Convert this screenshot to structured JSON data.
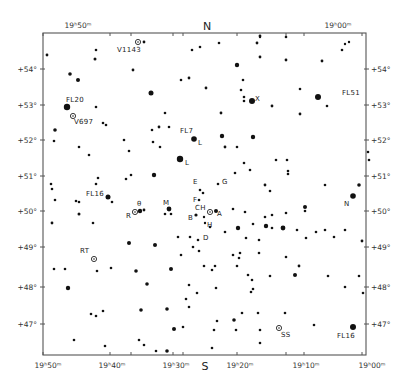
{
  "chart_data": {
    "type": "scatter",
    "title": "",
    "subtitle": "Star field finder chart (Cygnus region)",
    "xlabel": "Right Ascension",
    "ylabel": "Declination",
    "cardinal": {
      "top": "N",
      "bottom": "S"
    },
    "frame": {
      "left": 43,
      "top": 33,
      "right": 366,
      "bottom": 355
    },
    "ra_ticks": [
      {
        "label": "19ʰ50ᵐ",
        "x": 43,
        "top_label": true,
        "bottom_label": true
      },
      {
        "label": "19ʰ40ᵐ",
        "x": 110,
        "top_label": false,
        "bottom_label": true
      },
      {
        "label": "",
        "x": 131,
        "top_label": false,
        "bottom_label": false
      },
      {
        "label": "19ʰ30ᵐ",
        "x": 173,
        "top_label": false,
        "bottom_label": true
      },
      {
        "label": "",
        "x": 183,
        "top_label": false,
        "bottom_label": false
      },
      {
        "label": "19ʰ20ᵐ",
        "x": 237,
        "top_label": false,
        "bottom_label": true
      },
      {
        "label": "",
        "x": 286,
        "top_label": false,
        "bottom_label": false
      },
      {
        "label": "19ʰ10ᵐ",
        "x": 304,
        "top_label": false,
        "bottom_label": true
      },
      {
        "label": "19ʰ00ᵐ",
        "x": 362,
        "top_label": true,
        "bottom_label": true
      }
    ],
    "top_ra_labels": [
      {
        "label": "19ʰ50ᵐ",
        "x": 78
      },
      {
        "label": "19ʰ00ᵐ",
        "x": 338
      }
    ],
    "bottom_ra_labels": [
      {
        "label": "19ʰ50ᵐ",
        "x": 48
      },
      {
        "label": "19ʰ40ᵐ",
        "x": 112
      },
      {
        "label": "19ʰ30ᵐ",
        "x": 176
      },
      {
        "label": "19ʰ20ᵐ",
        "x": 240
      },
      {
        "label": "19ʰ10ᵐ",
        "x": 306
      },
      {
        "label": "19ʰ00ᵐ",
        "x": 372
      }
    ],
    "dec_ticks": [
      {
        "label": "+54°",
        "y": 69
      },
      {
        "label": "+53°",
        "y": 105
      },
      {
        "label": "+52°",
        "y": 140
      },
      {
        "label": "+51°",
        "y": 176
      },
      {
        "label": "+50°",
        "y": 211
      },
      {
        "label": "+49°",
        "y": 247
      },
      {
        "label": "+48°",
        "y": 287
      },
      {
        "label": "+47°",
        "y": 324
      }
    ],
    "grid": false,
    "legend": "none",
    "labels": [
      {
        "text": "V1143",
        "x": 117,
        "y": 52
      },
      {
        "text": "FL20",
        "x": 66,
        "y": 102
      },
      {
        "text": "V697",
        "x": 74,
        "y": 124
      },
      {
        "text": "FL51",
        "x": 342,
        "y": 95
      },
      {
        "text": "X",
        "x": 255,
        "y": 101
      },
      {
        "text": "FL7",
        "x": 180,
        "y": 133
      },
      {
        "text": "L",
        "x": 198,
        "y": 145
      },
      {
        "text": "L",
        "x": 185,
        "y": 165
      },
      {
        "text": "E",
        "x": 193,
        "y": 184
      },
      {
        "text": "G",
        "x": 222,
        "y": 184
      },
      {
        "text": "F",
        "x": 193,
        "y": 202
      },
      {
        "text": "CH",
        "x": 195,
        "y": 210
      },
      {
        "text": "FL16",
        "x": 86,
        "y": 196
      },
      {
        "text": "θ",
        "x": 137,
        "y": 206
      },
      {
        "text": "M",
        "x": 163,
        "y": 205
      },
      {
        "text": "R",
        "x": 126,
        "y": 218
      },
      {
        "text": "B",
        "x": 188,
        "y": 220
      },
      {
        "text": "A",
        "x": 217,
        "y": 216
      },
      {
        "text": "H",
        "x": 207,
        "y": 227
      },
      {
        "text": "N",
        "x": 344,
        "y": 206
      },
      {
        "text": "D",
        "x": 203,
        "y": 240
      },
      {
        "text": "RT",
        "x": 80,
        "y": 253
      },
      {
        "text": "SS",
        "x": 281,
        "y": 337
      },
      {
        "text": "FL16",
        "x": 337,
        "y": 338
      }
    ],
    "variables": [
      {
        "name": "V1143",
        "x": 138,
        "y": 42
      },
      {
        "name": "V697",
        "x": 73,
        "y": 116
      },
      {
        "name": "RT",
        "x": 94,
        "y": 259
      },
      {
        "name": "SS",
        "x": 279,
        "y": 328
      },
      {
        "name": "R",
        "x": 135,
        "y": 212
      },
      {
        "name": "CH",
        "x": 210,
        "y": 212
      }
    ],
    "stars": [
      {
        "x": 47,
        "y": 55,
        "s": 1.4
      },
      {
        "x": 96,
        "y": 50,
        "s": 1.3
      },
      {
        "x": 95,
        "y": 59,
        "s": 1.5
      },
      {
        "x": 144,
        "y": 42,
        "s": 1.4
      },
      {
        "x": 133,
        "y": 70,
        "s": 1.4
      },
      {
        "x": 70,
        "y": 74,
        "s": 1.8
      },
      {
        "x": 78,
        "y": 80,
        "s": 2.0
      },
      {
        "x": 151,
        "y": 93,
        "s": 2.5
      },
      {
        "x": 96,
        "y": 107,
        "s": 1.3
      },
      {
        "x": 67,
        "y": 107,
        "s": 3.2
      },
      {
        "x": 192,
        "y": 50,
        "s": 1.3
      },
      {
        "x": 200,
        "y": 47,
        "s": 1.3
      },
      {
        "x": 181,
        "y": 80,
        "s": 1.3
      },
      {
        "x": 189,
        "y": 78,
        "s": 1.4
      },
      {
        "x": 206,
        "y": 88,
        "s": 1.4
      },
      {
        "x": 219,
        "y": 43,
        "s": 1.3
      },
      {
        "x": 257,
        "y": 43,
        "s": 1.4
      },
      {
        "x": 260,
        "y": 36,
        "s": 1.4
      },
      {
        "x": 237,
        "y": 65,
        "s": 2.2
      },
      {
        "x": 243,
        "y": 80,
        "s": 1.3
      },
      {
        "x": 241,
        "y": 90,
        "s": 1.3
      },
      {
        "x": 244,
        "y": 97,
        "s": 1.3
      },
      {
        "x": 244,
        "y": 101,
        "s": 1.3
      },
      {
        "x": 252,
        "y": 101,
        "s": 3.0
      },
      {
        "x": 260,
        "y": 37,
        "s": 1.2
      },
      {
        "x": 286,
        "y": 37,
        "s": 1.3
      },
      {
        "x": 260,
        "y": 57,
        "s": 1.4
      },
      {
        "x": 286,
        "y": 60,
        "s": 1.4
      },
      {
        "x": 322,
        "y": 61,
        "s": 1.4
      },
      {
        "x": 345,
        "y": 44,
        "s": 1.2
      },
      {
        "x": 349,
        "y": 42,
        "s": 1.2
      },
      {
        "x": 342,
        "y": 50,
        "s": 1.3
      },
      {
        "x": 300,
        "y": 89,
        "s": 1.3
      },
      {
        "x": 318,
        "y": 97,
        "s": 3.0
      },
      {
        "x": 327,
        "y": 106,
        "s": 1.3
      },
      {
        "x": 272,
        "y": 106,
        "s": 1.4
      },
      {
        "x": 300,
        "y": 114,
        "s": 1.4
      },
      {
        "x": 221,
        "y": 113,
        "s": 1.4
      },
      {
        "x": 55,
        "y": 130,
        "s": 1.8
      },
      {
        "x": 54,
        "y": 141,
        "s": 1.3
      },
      {
        "x": 79,
        "y": 147,
        "s": 1.3
      },
      {
        "x": 89,
        "y": 155,
        "s": 1.3
      },
      {
        "x": 103,
        "y": 123,
        "s": 1.3
      },
      {
        "x": 106,
        "y": 125,
        "s": 1.3
      },
      {
        "x": 124,
        "y": 140,
        "s": 1.3
      },
      {
        "x": 129,
        "y": 151,
        "s": 1.3
      },
      {
        "x": 153,
        "y": 142,
        "s": 1.3
      },
      {
        "x": 160,
        "y": 147,
        "s": 1.3
      },
      {
        "x": 159,
        "y": 127,
        "s": 1.4
      },
      {
        "x": 152,
        "y": 130,
        "s": 1.3
      },
      {
        "x": 165,
        "y": 113,
        "s": 1.3
      },
      {
        "x": 169,
        "y": 127,
        "s": 1.3
      },
      {
        "x": 194,
        "y": 139,
        "s": 2.8
      },
      {
        "x": 180,
        "y": 159,
        "s": 3.2
      },
      {
        "x": 154,
        "y": 175,
        "s": 2.2
      },
      {
        "x": 131,
        "y": 175,
        "s": 1.3
      },
      {
        "x": 126,
        "y": 179,
        "s": 1.3
      },
      {
        "x": 98,
        "y": 178,
        "s": 1.3
      },
      {
        "x": 96,
        "y": 184,
        "s": 1.3
      },
      {
        "x": 108,
        "y": 197,
        "s": 2.5
      },
      {
        "x": 112,
        "y": 202,
        "s": 1.3
      },
      {
        "x": 51,
        "y": 184,
        "s": 1.3
      },
      {
        "x": 52,
        "y": 189,
        "s": 1.3
      },
      {
        "x": 55,
        "y": 200,
        "s": 1.3
      },
      {
        "x": 76,
        "y": 201,
        "s": 1.3
      },
      {
        "x": 79,
        "y": 202,
        "s": 1.3
      },
      {
        "x": 79,
        "y": 214,
        "s": 1.5
      },
      {
        "x": 52,
        "y": 223,
        "s": 1.4
      },
      {
        "x": 93,
        "y": 223,
        "s": 1.3
      },
      {
        "x": 140,
        "y": 211,
        "s": 2.2
      },
      {
        "x": 144,
        "y": 210,
        "s": 1.4
      },
      {
        "x": 169,
        "y": 209,
        "s": 2.4
      },
      {
        "x": 165,
        "y": 214,
        "s": 1.3
      },
      {
        "x": 171,
        "y": 214,
        "s": 1.3
      },
      {
        "x": 200,
        "y": 190,
        "s": 1.3
      },
      {
        "x": 203,
        "y": 193,
        "s": 1.3
      },
      {
        "x": 199,
        "y": 200,
        "s": 1.3
      },
      {
        "x": 218,
        "y": 184,
        "s": 1.3
      },
      {
        "x": 196,
        "y": 215,
        "s": 1.6
      },
      {
        "x": 204,
        "y": 217,
        "s": 1.2
      },
      {
        "x": 205,
        "y": 223,
        "s": 1.2
      },
      {
        "x": 216,
        "y": 211,
        "s": 2.0
      },
      {
        "x": 233,
        "y": 209,
        "s": 1.3
      },
      {
        "x": 245,
        "y": 212,
        "s": 1.3
      },
      {
        "x": 237,
        "y": 147,
        "s": 1.3
      },
      {
        "x": 225,
        "y": 147,
        "s": 1.4
      },
      {
        "x": 222,
        "y": 136,
        "s": 2.2
      },
      {
        "x": 253,
        "y": 137,
        "s": 2.2
      },
      {
        "x": 244,
        "y": 163,
        "s": 1.3
      },
      {
        "x": 276,
        "y": 160,
        "s": 1.3
      },
      {
        "x": 287,
        "y": 160,
        "s": 1.3
      },
      {
        "x": 288,
        "y": 171,
        "s": 1.3
      },
      {
        "x": 288,
        "y": 174,
        "s": 1.3
      },
      {
        "x": 270,
        "y": 191,
        "s": 1.3
      },
      {
        "x": 265,
        "y": 185,
        "s": 1.4
      },
      {
        "x": 235,
        "y": 173,
        "s": 1.3
      },
      {
        "x": 250,
        "y": 170,
        "s": 1.3
      },
      {
        "x": 272,
        "y": 215,
        "s": 1.3
      },
      {
        "x": 305,
        "y": 207,
        "s": 2.0
      },
      {
        "x": 305,
        "y": 211,
        "s": 1.3
      },
      {
        "x": 286,
        "y": 213,
        "s": 1.3
      },
      {
        "x": 325,
        "y": 185,
        "s": 1.3
      },
      {
        "x": 368,
        "y": 152,
        "s": 1.3
      },
      {
        "x": 369,
        "y": 160,
        "s": 1.3
      },
      {
        "x": 359,
        "y": 185,
        "s": 1.8
      },
      {
        "x": 353,
        "y": 196,
        "s": 2.8
      },
      {
        "x": 265,
        "y": 217,
        "s": 1.3
      },
      {
        "x": 266,
        "y": 226,
        "s": 2.2
      },
      {
        "x": 238,
        "y": 228,
        "s": 2.2
      },
      {
        "x": 253,
        "y": 224,
        "s": 1.3
      },
      {
        "x": 272,
        "y": 228,
        "s": 1.3
      },
      {
        "x": 283,
        "y": 228,
        "s": 2.4
      },
      {
        "x": 297,
        "y": 230,
        "s": 1.3
      },
      {
        "x": 306,
        "y": 238,
        "s": 1.3
      },
      {
        "x": 316,
        "y": 232,
        "s": 1.3
      },
      {
        "x": 325,
        "y": 230,
        "s": 1.3
      },
      {
        "x": 334,
        "y": 237,
        "s": 1.3
      },
      {
        "x": 345,
        "y": 230,
        "s": 1.3
      },
      {
        "x": 362,
        "y": 241,
        "s": 1.4
      },
      {
        "x": 246,
        "y": 238,
        "s": 1.3
      },
      {
        "x": 259,
        "y": 240,
        "s": 1.3
      },
      {
        "x": 225,
        "y": 232,
        "s": 1.3
      },
      {
        "x": 210,
        "y": 227,
        "s": 1.3
      },
      {
        "x": 198,
        "y": 240,
        "s": 1.3
      },
      {
        "x": 193,
        "y": 247,
        "s": 1.3
      },
      {
        "x": 190,
        "y": 237,
        "s": 1.3
      },
      {
        "x": 178,
        "y": 237,
        "s": 1.3
      },
      {
        "x": 129,
        "y": 243,
        "s": 2.0
      },
      {
        "x": 155,
        "y": 245,
        "s": 2.0
      },
      {
        "x": 199,
        "y": 251,
        "s": 1.3
      },
      {
        "x": 181,
        "y": 255,
        "s": 1.3
      },
      {
        "x": 233,
        "y": 255,
        "s": 1.3
      },
      {
        "x": 239,
        "y": 258,
        "s": 1.3
      },
      {
        "x": 240,
        "y": 253,
        "s": 1.3
      },
      {
        "x": 259,
        "y": 253,
        "s": 1.3
      },
      {
        "x": 286,
        "y": 257,
        "s": 1.3
      },
      {
        "x": 299,
        "y": 266,
        "s": 1.4
      },
      {
        "x": 237,
        "y": 266,
        "s": 1.3
      },
      {
        "x": 215,
        "y": 266,
        "s": 1.3
      },
      {
        "x": 248,
        "y": 275,
        "s": 1.3
      },
      {
        "x": 270,
        "y": 276,
        "s": 1.3
      },
      {
        "x": 295,
        "y": 275,
        "s": 2.0
      },
      {
        "x": 328,
        "y": 276,
        "s": 1.3
      },
      {
        "x": 359,
        "y": 276,
        "s": 1.3
      },
      {
        "x": 204,
        "y": 266,
        "s": 1.3
      },
      {
        "x": 212,
        "y": 270,
        "s": 1.3
      },
      {
        "x": 216,
        "y": 288,
        "s": 1.3
      },
      {
        "x": 252,
        "y": 280,
        "s": 1.3
      },
      {
        "x": 251,
        "y": 292,
        "s": 1.3
      },
      {
        "x": 253,
        "y": 289,
        "s": 1.3
      },
      {
        "x": 345,
        "y": 287,
        "s": 1.3
      },
      {
        "x": 363,
        "y": 293,
        "s": 1.3
      },
      {
        "x": 54,
        "y": 269,
        "s": 1.3
      },
      {
        "x": 65,
        "y": 269,
        "s": 1.3
      },
      {
        "x": 97,
        "y": 271,
        "s": 1.3
      },
      {
        "x": 111,
        "y": 268,
        "s": 1.3
      },
      {
        "x": 136,
        "y": 271,
        "s": 1.8
      },
      {
        "x": 171,
        "y": 269,
        "s": 2.0
      },
      {
        "x": 147,
        "y": 284,
        "s": 1.8
      },
      {
        "x": 68,
        "y": 288,
        "s": 2.2
      },
      {
        "x": 189,
        "y": 285,
        "s": 1.3
      },
      {
        "x": 197,
        "y": 293,
        "s": 1.3
      },
      {
        "x": 186,
        "y": 299,
        "s": 1.3
      },
      {
        "x": 189,
        "y": 307,
        "s": 1.3
      },
      {
        "x": 91,
        "y": 314,
        "s": 1.3
      },
      {
        "x": 96,
        "y": 316,
        "s": 1.3
      },
      {
        "x": 103,
        "y": 311,
        "s": 1.3
      },
      {
        "x": 141,
        "y": 310,
        "s": 1.8
      },
      {
        "x": 167,
        "y": 309,
        "s": 1.8
      },
      {
        "x": 183,
        "y": 327,
        "s": 1.3
      },
      {
        "x": 174,
        "y": 329,
        "s": 2.0
      },
      {
        "x": 217,
        "y": 321,
        "s": 1.3
      },
      {
        "x": 234,
        "y": 320,
        "s": 1.8
      },
      {
        "x": 242,
        "y": 313,
        "s": 1.3
      },
      {
        "x": 258,
        "y": 313,
        "s": 1.3
      },
      {
        "x": 285,
        "y": 313,
        "s": 1.3
      },
      {
        "x": 214,
        "y": 330,
        "s": 1.3
      },
      {
        "x": 236,
        "y": 330,
        "s": 1.3
      },
      {
        "x": 260,
        "y": 330,
        "s": 1.3
      },
      {
        "x": 314,
        "y": 325,
        "s": 1.3
      },
      {
        "x": 353,
        "y": 327,
        "s": 3.0
      },
      {
        "x": 74,
        "y": 340,
        "s": 1.3
      },
      {
        "x": 105,
        "y": 346,
        "s": 1.3
      },
      {
        "x": 139,
        "y": 340,
        "s": 1.3
      },
      {
        "x": 144,
        "y": 345,
        "s": 1.3
      },
      {
        "x": 156,
        "y": 351,
        "s": 1.3
      },
      {
        "x": 167,
        "y": 351,
        "s": 1.8
      },
      {
        "x": 212,
        "y": 348,
        "s": 1.3
      },
      {
        "x": 260,
        "y": 343,
        "s": 1.3
      }
    ]
  }
}
